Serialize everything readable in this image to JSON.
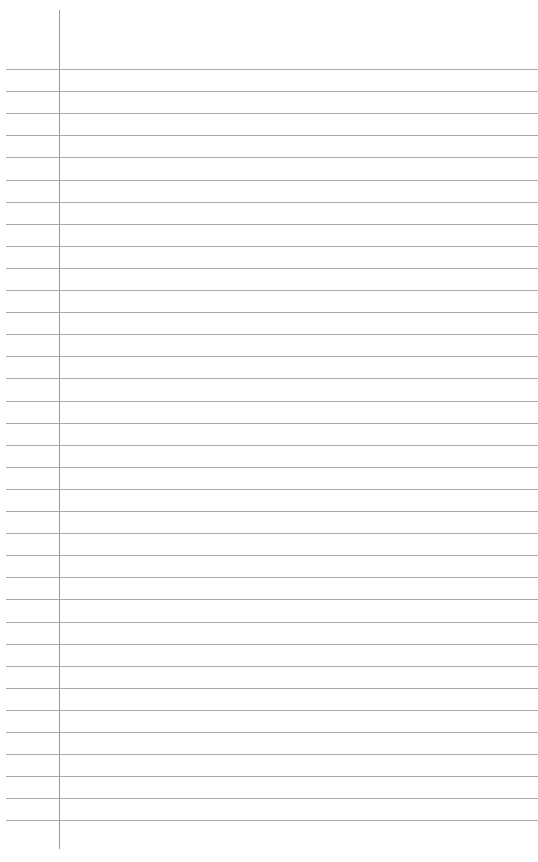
{
  "paper": {
    "type": "lined-paper",
    "line_count": 35,
    "first_line_y": 69,
    "line_spacing": 22.1,
    "line_color": "#a8a8a8",
    "margin_color": "#9a9a9a",
    "margin_x": 59,
    "text": ""
  }
}
